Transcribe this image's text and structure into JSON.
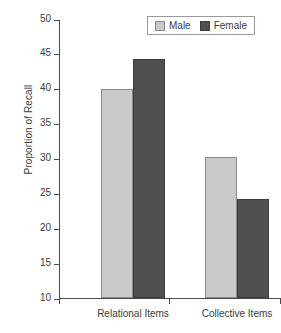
{
  "chart_data": {
    "type": "bar",
    "title": "",
    "xlabel": "",
    "ylabel": "Proportion of Recall",
    "categories": [
      "Relational Items",
      "Collective Items"
    ],
    "series": [
      {
        "name": "Male",
        "color": "#c9c9c9",
        "values": [
          40.0,
          30.2
        ]
      },
      {
        "name": "Female",
        "color": "#4f4f4f",
        "values": [
          44.2,
          24.2
        ]
      }
    ],
    "ylim": [
      10,
      50
    ],
    "yticks": [
      50,
      45,
      40,
      35,
      30,
      25,
      20,
      15,
      10
    ],
    "ytick_labels": [
      "50",
      "45",
      "40",
      "35",
      "30",
      "25",
      "20",
      "15",
      "10"
    ],
    "grid": false,
    "legend_position": "top-right",
    "legend_entries": [
      "Male",
      "Female"
    ]
  },
  "axis": {
    "y_title": "Proportion of Recall",
    "ticks": [
      "50",
      "45",
      "40",
      "35",
      "30",
      "25",
      "20",
      "15",
      "10"
    ]
  },
  "legend": {
    "items": [
      {
        "label": "Male",
        "swatch": "male-swatch"
      },
      {
        "label": "Female",
        "swatch": "female-swatch"
      }
    ]
  },
  "categories": [
    {
      "label": "Relational Items"
    },
    {
      "label": "Collective Items"
    }
  ],
  "caption": {
    "partial_text": ""
  }
}
